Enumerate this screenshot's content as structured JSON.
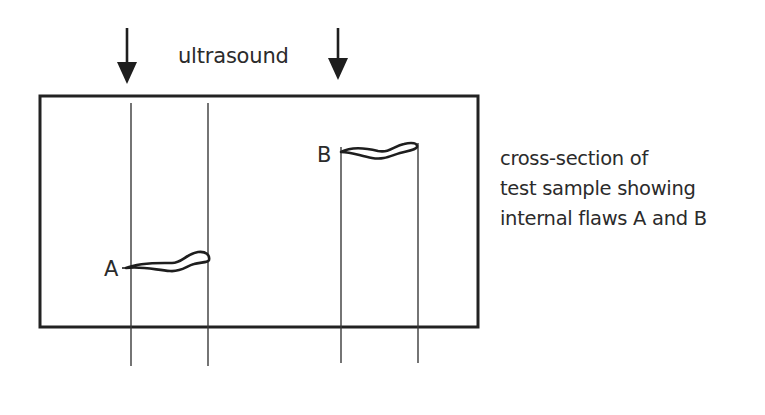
{
  "diagram": {
    "title_label": "ultrasound",
    "flaws": [
      {
        "id": "A",
        "label": "A"
      },
      {
        "id": "B",
        "label": "B"
      }
    ],
    "caption": {
      "lines": [
        "cross-section of",
        "test sample showing",
        "internal flaws A and B"
      ]
    },
    "colors": {
      "stroke": "#222222",
      "thin_line": "#3a3a3a",
      "text": "#2b2b2b",
      "background": "#ffffff"
    },
    "ultrasound_arrows": [
      {
        "name": "left-arrow",
        "x": 127
      },
      {
        "name": "right-arrow",
        "x": 338
      }
    ],
    "sample_rectangle": {
      "x": 40,
      "y": 96,
      "width": 438,
      "height": 231
    },
    "beam_lines_x": [
      131,
      208,
      341,
      418
    ]
  }
}
